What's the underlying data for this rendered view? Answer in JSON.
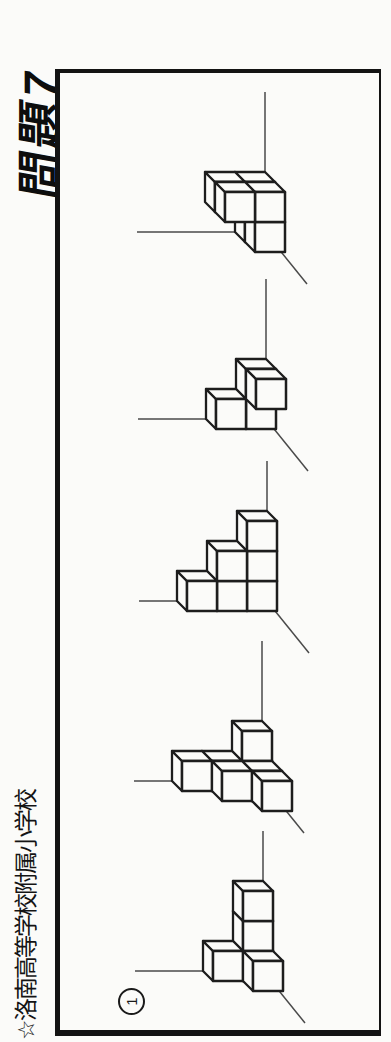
{
  "header": {
    "school": "☆洛南高等学校附属小学校",
    "title": "問題7"
  },
  "frame": {
    "question_number": "1"
  },
  "style": {
    "paper_color": "#fbfbf9",
    "ink_color": "#1d1d1d",
    "axis_line_color": "#4a4a4a",
    "cube_size": 30,
    "depth_offset": 10
  },
  "figures": [
    {
      "name": "figure-1",
      "cube_count": 5,
      "origin_x": 51,
      "floor_y": 283,
      "cubes": [
        [
          0,
          0,
          0
        ],
        [
          0,
          0,
          1
        ],
        [
          0,
          1,
          1
        ],
        [
          1,
          0,
          1
        ],
        [
          2,
          0,
          1
        ]
      ]
    },
    {
      "name": "figure-2",
      "cube_count": 7,
      "origin_x": 231,
      "floor_y": 292,
      "cubes": [
        [
          0,
          0,
          0
        ],
        [
          0,
          0,
          1
        ],
        [
          0,
          1,
          1
        ],
        [
          0,
          0,
          2
        ],
        [
          0,
          1,
          2
        ],
        [
          0,
          2,
          2
        ],
        [
          1,
          0,
          2
        ]
      ]
    },
    {
      "name": "figure-3",
      "cube_count": 6,
      "origin_x": 431,
      "floor_y": 277,
      "cubes": [
        [
          0,
          0,
          0
        ],
        [
          1,
          0,
          0
        ],
        [
          2,
          0,
          0
        ],
        [
          0,
          1,
          0
        ],
        [
          1,
          1,
          0
        ],
        [
          0,
          2,
          0
        ]
      ]
    },
    {
      "name": "figure-4",
      "cube_count": 4,
      "origin_x": 603,
      "floor_y": 286,
      "cubes": [
        [
          1,
          0,
          0
        ],
        [
          0,
          0,
          1
        ],
        [
          1,
          0,
          1
        ],
        [
          0,
          1,
          1
        ]
      ]
    },
    {
      "name": "figure-5",
      "cube_count": 6,
      "origin_x": 790,
      "floor_y": 285,
      "cubes": [
        [
          0,
          0,
          0
        ],
        [
          1,
          0,
          0
        ],
        [
          1,
          1,
          0
        ],
        [
          0,
          0,
          1
        ],
        [
          1,
          0,
          1
        ],
        [
          1,
          1,
          1
        ]
      ]
    }
  ],
  "axis_lines": {
    "up_length": 128,
    "right_length": 140,
    "diagonal_dx": -52,
    "diagonal_dy": 42
  }
}
